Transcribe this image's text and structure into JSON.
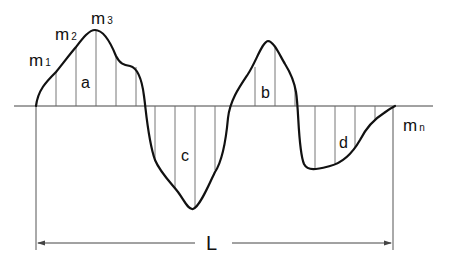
{
  "diagram": {
    "type": "area-under-curve",
    "points": {
      "m1": {
        "label": "m",
        "sub": "1"
      },
      "m2": {
        "label": "m",
        "sub": "2"
      },
      "m3": {
        "label": "m",
        "sub": "3"
      },
      "mn": {
        "label": "m",
        "sub": "n"
      }
    },
    "areas": {
      "a": "a",
      "b": "b",
      "c": "c",
      "d": "d"
    },
    "length_label": "L",
    "colors": {
      "curve": "#111111",
      "hatch": "#555555",
      "axis": "#444444",
      "background": "#ffffff"
    }
  }
}
